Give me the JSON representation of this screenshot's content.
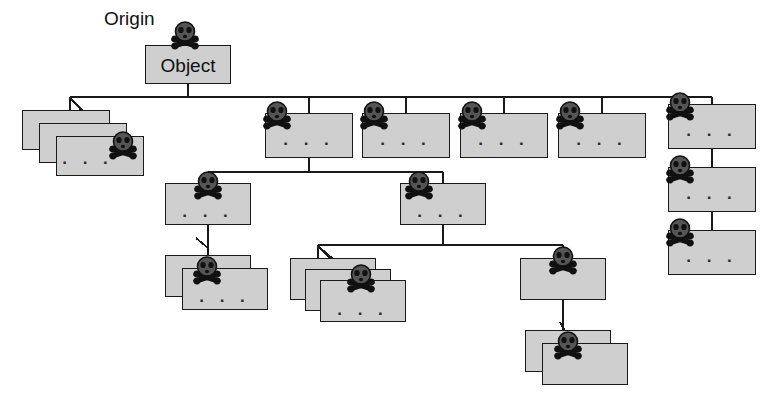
{
  "diagram": {
    "title_label": "Origin",
    "root_label": "Object",
    "ellipsis": "· · ·",
    "icon_name": "skull-and-crossbones-icon",
    "colors": {
      "box_fill": "#cfcfcf",
      "box_stroke": "#1a1a1a",
      "edge_stroke": "#1a1a1a",
      "skull_fill": "#555555",
      "skull_outline": "#111111",
      "background": "#ffffff",
      "text": "#111111"
    },
    "nodes": [
      {
        "id": "root",
        "label": "Object",
        "x": 145,
        "y": 45,
        "w": 86,
        "h": 39,
        "stack": 1,
        "skull": "top-center",
        "dots": false
      },
      {
        "id": "n-left-stack",
        "label": "",
        "x": 22,
        "y": 110,
        "w": 88,
        "h": 40,
        "stack": 3,
        "skull": "front-right",
        "dots": true
      },
      {
        "id": "r2-a",
        "label": "",
        "x": 265,
        "y": 113,
        "w": 88,
        "h": 45,
        "stack": 1,
        "skull": "top-left",
        "dots": true
      },
      {
        "id": "r2-b",
        "label": "",
        "x": 362,
        "y": 113,
        "w": 88,
        "h": 45,
        "stack": 1,
        "skull": "top-left",
        "dots": true
      },
      {
        "id": "r2-c",
        "label": "",
        "x": 460,
        "y": 113,
        "w": 88,
        "h": 45,
        "stack": 1,
        "skull": "top-left",
        "dots": true
      },
      {
        "id": "r2-d",
        "label": "",
        "x": 558,
        "y": 113,
        "w": 88,
        "h": 45,
        "stack": 1,
        "skull": "top-left",
        "dots": true
      },
      {
        "id": "r2-e",
        "label": "",
        "x": 668,
        "y": 104,
        "w": 88,
        "h": 45,
        "stack": 1,
        "skull": "top-left",
        "dots": true
      },
      {
        "id": "r3-e1",
        "label": "",
        "x": 668,
        "y": 167,
        "w": 88,
        "h": 45,
        "stack": 1,
        "skull": "top-left",
        "dots": true
      },
      {
        "id": "r3-e2",
        "label": "",
        "x": 668,
        "y": 230,
        "w": 88,
        "h": 45,
        "stack": 1,
        "skull": "top-left",
        "dots": true
      },
      {
        "id": "r3-l",
        "label": "",
        "x": 165,
        "y": 183,
        "w": 86,
        "h": 42,
        "stack": 1,
        "skull": "top-center",
        "dots": true
      },
      {
        "id": "r4-l",
        "label": "",
        "x": 165,
        "y": 255,
        "w": 86,
        "h": 42,
        "stack": 2,
        "skull": "front-center",
        "dots": true
      },
      {
        "id": "r3-m",
        "label": "",
        "x": 400,
        "y": 183,
        "w": 86,
        "h": 42,
        "stack": 1,
        "skull": "top-left",
        "dots": true
      },
      {
        "id": "r4-m",
        "label": "",
        "x": 290,
        "y": 258,
        "w": 86,
        "h": 42,
        "stack": 3,
        "skull": "front-center",
        "dots": true
      },
      {
        "id": "r4-r",
        "label": "",
        "x": 520,
        "y": 258,
        "w": 86,
        "h": 42,
        "stack": 1,
        "skull": "top-center",
        "dots": false
      },
      {
        "id": "r5-r",
        "label": "",
        "x": 525,
        "y": 330,
        "w": 86,
        "h": 42,
        "stack": 2,
        "skull": "front-center",
        "dots": false
      }
    ],
    "edges": [
      {
        "from": "root",
        "to": "trunk-left-stack",
        "kind": "tree"
      },
      {
        "from": "root",
        "to": "row2-bus",
        "kind": "tree"
      },
      {
        "from": "r2-a",
        "to": "row3-bus",
        "kind": "tree"
      },
      {
        "from": "r2-e",
        "to": "r3-e1",
        "kind": "chain"
      },
      {
        "from": "r3-e1",
        "to": "r3-e2",
        "kind": "chain"
      },
      {
        "from": "r3-l",
        "to": "r4-l",
        "kind": "chain"
      },
      {
        "from": "r3-m",
        "to": "row4-bus",
        "kind": "tree"
      },
      {
        "from": "r4-r",
        "to": "r5-r",
        "kind": "chain"
      }
    ]
  }
}
